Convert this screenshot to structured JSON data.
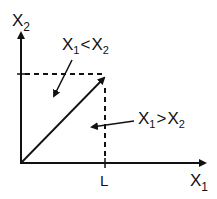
{
  "diagram": {
    "axes": {
      "x_label": "X",
      "x_label_sub": "1",
      "y_label": "X",
      "y_label_sub": "2"
    },
    "tick_label": "L",
    "regions": [
      {
        "label_a": "X",
        "sub_a": "1",
        "op": "<",
        "label_b": "X",
        "sub_b": "2"
      },
      {
        "label_a": "X",
        "sub_a": "1",
        "op": ">",
        "label_b": "X",
        "sub_b": "2"
      }
    ],
    "colors": {
      "ink": "#111111",
      "background": "#ffffff"
    }
  }
}
